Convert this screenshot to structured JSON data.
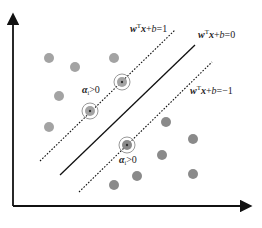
{
  "diagram": {
    "axes": {
      "x_origin": 13,
      "y_origin": 206,
      "x_end": 250,
      "y_top": 15
    },
    "lines": [
      {
        "name": "upper-margin",
        "style": "dashed",
        "x1": 40,
        "y1": 161,
        "x2": 175,
        "y2": 30,
        "label": {
          "w": "w",
          "sup": "T",
          "rest_x": "x",
          "plus": "+",
          "b": "b",
          "eq": "=1",
          "x": 130,
          "y": 32
        }
      },
      {
        "name": "decision-boundary",
        "style": "solid",
        "x1": 60,
        "y1": 175,
        "x2": 195,
        "y2": 45,
        "label": {
          "w": "w",
          "sup": "T",
          "rest_x": "x",
          "plus": "+",
          "b": "b",
          "eq": "=0",
          "x": 198,
          "y": 38
        }
      },
      {
        "name": "lower-margin",
        "style": "dashed",
        "x1": 79,
        "y1": 192,
        "x2": 212,
        "y2": 62,
        "label": {
          "w": "w",
          "sup": "T",
          "rest_x": "x",
          "plus": "+",
          "b": "b",
          "eq": "=−1",
          "x": 190,
          "y": 94
        }
      }
    ],
    "alpha_labels": [
      {
        "alpha": "α",
        "sub": "i",
        "rest": ">0",
        "x": 82,
        "y": 93
      },
      {
        "alpha": "α",
        "sub": "i",
        "rest": ">0",
        "x": 119,
        "y": 163
      }
    ],
    "colors": {
      "class_a": "#a3a3a3",
      "class_b": "#8a8a8a",
      "line": "#111111",
      "ring": "#999999"
    },
    "class_a_points": [
      {
        "x": 49,
        "y": 58
      },
      {
        "x": 75,
        "y": 67
      },
      {
        "x": 114,
        "y": 58
      },
      {
        "x": 59,
        "y": 96
      },
      {
        "x": 49,
        "y": 127
      }
    ],
    "class_b_points": [
      {
        "x": 166,
        "y": 122
      },
      {
        "x": 193,
        "y": 139
      },
      {
        "x": 162,
        "y": 155
      },
      {
        "x": 137,
        "y": 176
      },
      {
        "x": 114,
        "y": 185
      },
      {
        "x": 193,
        "y": 174
      }
    ],
    "support_vectors": [
      {
        "x": 122,
        "y": 82,
        "class": "a"
      },
      {
        "x": 90,
        "y": 111,
        "class": "a"
      },
      {
        "x": 127,
        "y": 145,
        "class": "b"
      }
    ]
  }
}
